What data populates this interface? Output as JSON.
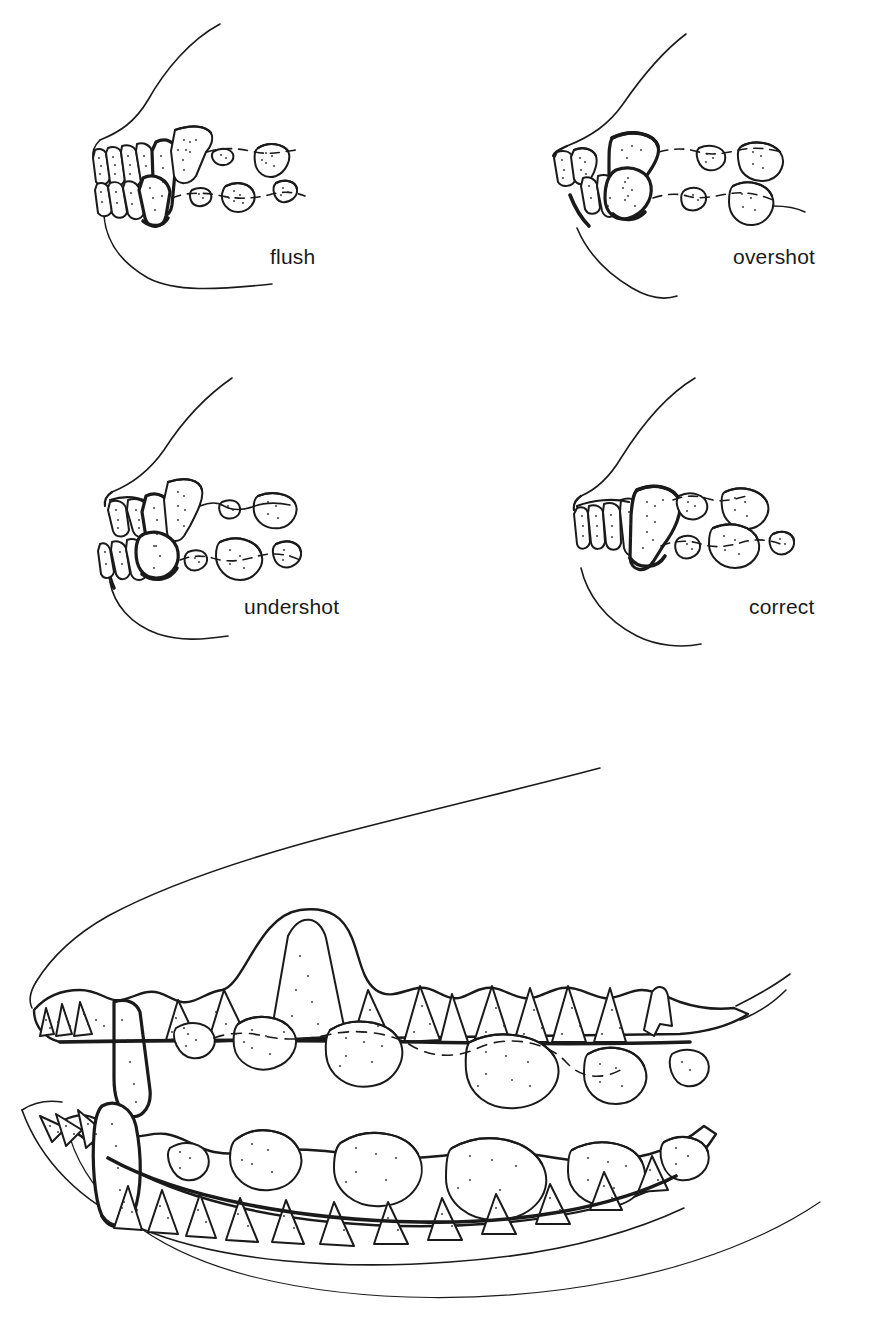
{
  "figure": {
    "background_color": "#ffffff",
    "ink_color": "#1a1a1a",
    "width": 874,
    "height": 1320,
    "style": "pen-and-ink line drawing with stipple shading"
  },
  "panels": [
    {
      "id": "flush",
      "label": "flush",
      "position": "top-left",
      "description": "Lateral view of dog muzzle showing incisors meeting edge to edge"
    },
    {
      "id": "overshot",
      "label": "overshot",
      "position": "top-right",
      "description": "Lateral view of dog muzzle showing upper jaw projecting beyond lower jaw"
    },
    {
      "id": "undershot",
      "label": "undershot",
      "position": "bottom-left",
      "description": "Lateral view of dog muzzle showing lower jaw projecting beyond upper jaw"
    },
    {
      "id": "correct",
      "label": "correct",
      "position": "bottom-right",
      "description": "Lateral view of dog muzzle showing correct scissors bite"
    }
  ],
  "main_illustration": {
    "id": "full-dentition",
    "caption": "",
    "description": "Large lateral view of complete canine skull dentition with upper and lower arcades, incisors, canines, premolars and molars"
  }
}
